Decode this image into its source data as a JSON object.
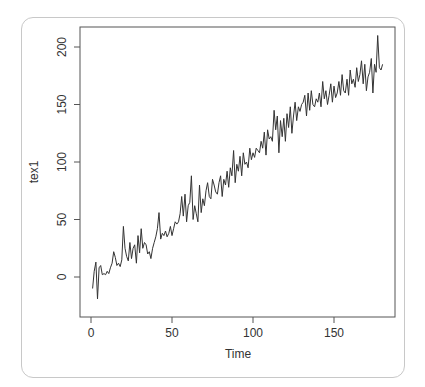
{
  "chart_data": {
    "type": "line",
    "title": "",
    "xlabel": "Time",
    "ylabel": "tex1",
    "xlim": [
      -4,
      185
    ],
    "ylim": [
      -22,
      218
    ],
    "x_ticks": [
      0,
      50,
      100,
      150
    ],
    "x_tick_labels": [
      "0",
      "50",
      "100",
      "150"
    ],
    "y_ticks": [
      0,
      50,
      100,
      150,
      200
    ],
    "y_tick_labels": [
      "0",
      "50",
      "100",
      "150",
      "200"
    ],
    "grid": false,
    "legend": null,
    "series": [
      {
        "name": "tex1",
        "color": "#333333",
        "x": [
          1,
          2,
          3,
          4,
          5,
          6,
          7,
          8,
          9,
          10,
          11,
          12,
          13,
          14,
          15,
          16,
          17,
          18,
          19,
          20,
          21,
          22,
          23,
          24,
          25,
          26,
          27,
          28,
          29,
          30,
          31,
          32,
          33,
          34,
          35,
          36,
          37,
          38,
          39,
          40,
          41,
          42,
          43,
          44,
          45,
          46,
          47,
          48,
          49,
          50,
          51,
          52,
          53,
          54,
          55,
          56,
          57,
          58,
          59,
          60,
          61,
          62,
          63,
          64,
          65,
          66,
          67,
          68,
          69,
          70,
          71,
          72,
          73,
          74,
          75,
          76,
          77,
          78,
          79,
          80,
          81,
          82,
          83,
          84,
          85,
          86,
          87,
          88,
          89,
          90,
          91,
          92,
          93,
          94,
          95,
          96,
          97,
          98,
          99,
          100,
          101,
          102,
          103,
          104,
          105,
          106,
          107,
          108,
          109,
          110,
          111,
          112,
          113,
          114,
          115,
          116,
          117,
          118,
          119,
          120,
          121,
          122,
          123,
          124,
          125,
          126,
          127,
          128,
          129,
          130,
          131,
          132,
          133,
          134,
          135,
          136,
          137,
          138,
          139,
          140,
          141,
          142,
          143,
          144,
          145,
          146,
          147,
          148,
          149,
          150,
          151,
          152,
          153,
          154,
          155,
          156,
          157,
          158,
          159,
          160,
          161,
          162,
          163,
          164,
          165,
          166,
          167,
          168,
          169,
          170,
          171,
          172,
          173,
          174,
          175,
          176,
          177,
          178,
          179,
          180
        ],
        "values": [
          -10,
          5,
          13,
          -19,
          8,
          10,
          2,
          3,
          2,
          5,
          3,
          8,
          12,
          22,
          17,
          10,
          12,
          9,
          15,
          44,
          25,
          18,
          14,
          30,
          16,
          25,
          28,
          12,
          36,
          21,
          42,
          25,
          30,
          28,
          20,
          22,
          16,
          25,
          30,
          35,
          42,
          56,
          33,
          38,
          36,
          40,
          35,
          38,
          44,
          36,
          42,
          48,
          46,
          48,
          55,
          70,
          53,
          72,
          48,
          62,
          65,
          88,
          50,
          62,
          55,
          48,
          80,
          56,
          68,
          62,
          75,
          82,
          70,
          68,
          85,
          80,
          74,
          72,
          82,
          88,
          70,
          85,
          80,
          92,
          78,
          95,
          88,
          110,
          82,
          98,
          92,
          105,
          88,
          108,
          98,
          100,
          95,
          112,
          102,
          108,
          104,
          112,
          110,
          108,
          118,
          112,
          126,
          106,
          128,
          120,
          122,
          118,
          145,
          128,
          140,
          108,
          136,
          122,
          138,
          118,
          142,
          130,
          148,
          125,
          140,
          152,
          136,
          148,
          144,
          150,
          152,
          158,
          140,
          160,
          145,
          162,
          150,
          148,
          155,
          152,
          160,
          148,
          170,
          155,
          162,
          150,
          158,
          168,
          152,
          166,
          156,
          160,
          170,
          158,
          176,
          162,
          160,
          172,
          158,
          180,
          168,
          172,
          165,
          182,
          170,
          176,
          188,
          168,
          185,
          162,
          174,
          178,
          190,
          160,
          185,
          178,
          210,
          182,
          180,
          185
        ]
      }
    ]
  },
  "plot": {
    "x_axis_title": "Time",
    "y_axis_title": "tex1"
  }
}
